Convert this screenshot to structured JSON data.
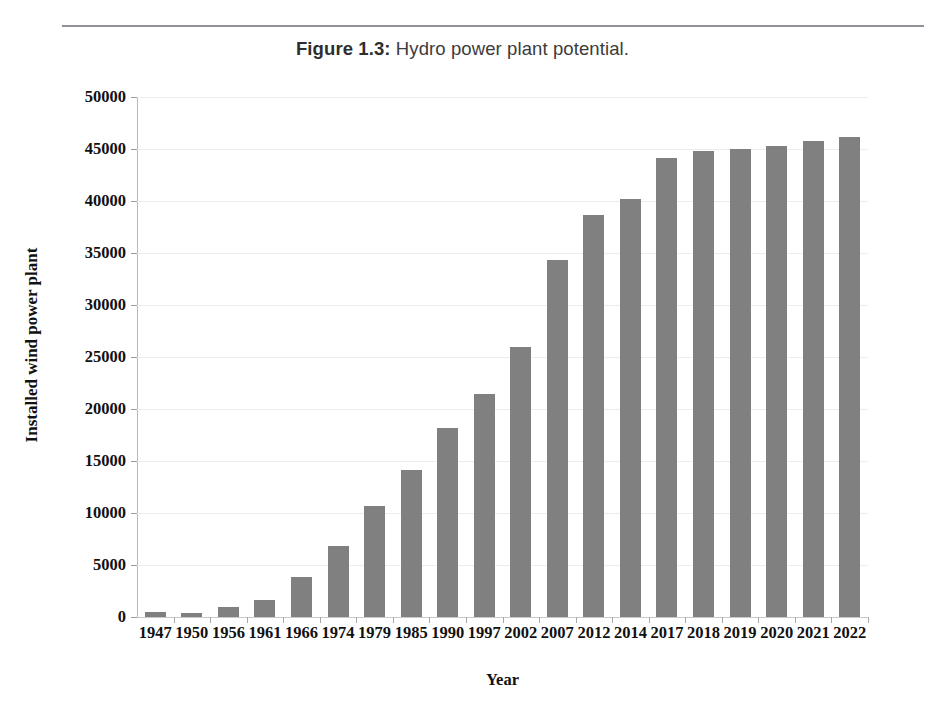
{
  "caption": {
    "label": "Figure 1.3:",
    "text": " Hydro power plant potential."
  },
  "chart_data": {
    "type": "bar",
    "title": "",
    "xlabel": "Year",
    "ylabel": "Installed wind power plant",
    "categories": [
      "1947",
      "1950",
      "1956",
      "1961",
      "1966",
      "1974",
      "1979",
      "1985",
      "1990",
      "1997",
      "2002",
      "2007",
      "2012",
      "2014",
      "2017",
      "2018",
      "2019",
      "2020",
      "2021",
      "2022"
    ],
    "values": [
      480,
      400,
      960,
      1650,
      3800,
      6800,
      10650,
      14150,
      18200,
      21450,
      26000,
      34300,
      38700,
      40200,
      44150,
      44850,
      45000,
      45300,
      45800,
      46200
    ],
    "ylim": [
      0,
      50000
    ],
    "yticks": [
      0,
      5000,
      10000,
      15000,
      20000,
      25000,
      30000,
      35000,
      40000,
      45000,
      50000
    ],
    "ytick_labels": [
      "0",
      "5000",
      "10000",
      "15000",
      "20000",
      "25000",
      "30000",
      "35000",
      "40000",
      "45000",
      "50000"
    ],
    "grid": true,
    "legend": false,
    "bar_color": "#808080",
    "grid_color": "#ededed",
    "axis_color": "#b9b9b9"
  }
}
